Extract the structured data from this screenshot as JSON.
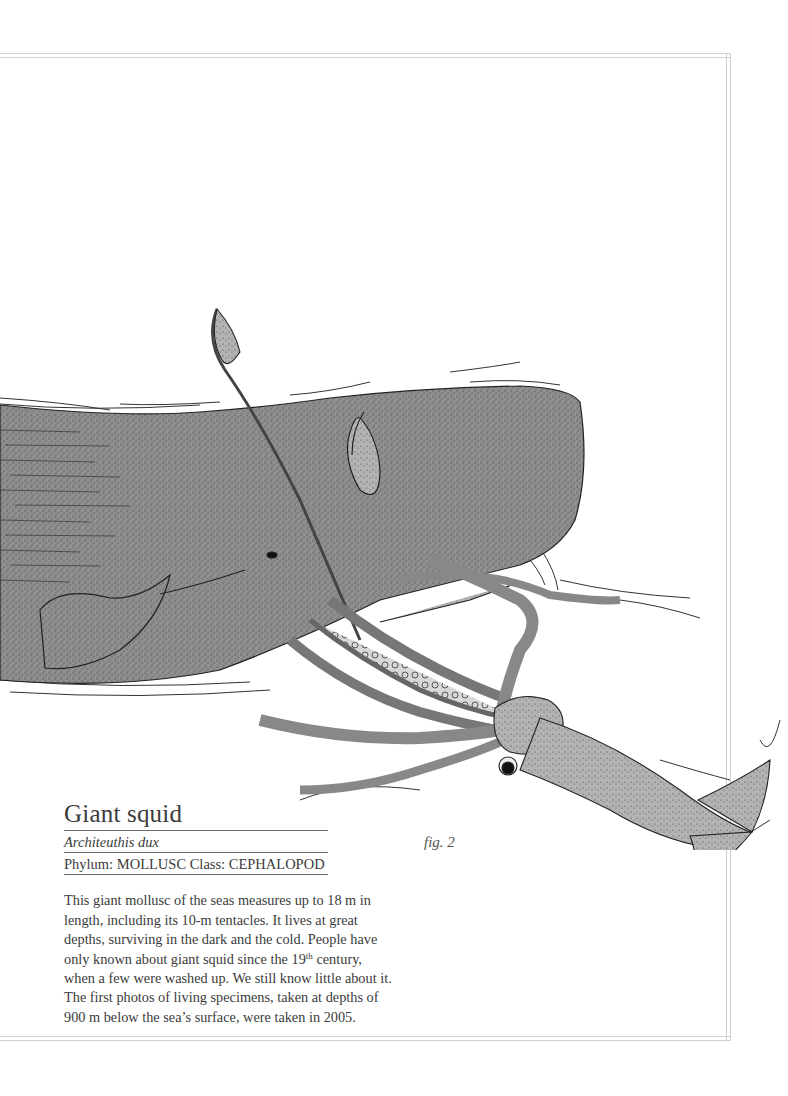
{
  "figure": {
    "label": "fig. 2"
  },
  "entry": {
    "common_name": "Giant squid",
    "scientific_name": "Architeuthis dux",
    "classification": "Phylum: MOLLUSC Class: CEPHALOPOD",
    "description": {
      "part1": "This giant mollusc of the seas measures up to 18 m in length, including its 10-m tentacles. It lives at great depths, surviving in the dark and the cold. People have only known about giant squid since the 19",
      "superscript": "th",
      "part2": " century, when a few were washed up. We still know little about it. The first photos of living specimens, taken at depths of 900 m below the sea’s surface, were taken in 2005."
    }
  },
  "illustration": {
    "subjects": [
      "sperm-whale",
      "giant-squid"
    ],
    "colors": {
      "whale_fill": "#8d8d8d",
      "squid_fill": "#a9a9a9",
      "ink": "#1f1f1f",
      "frame": "#cfcfcf"
    }
  }
}
